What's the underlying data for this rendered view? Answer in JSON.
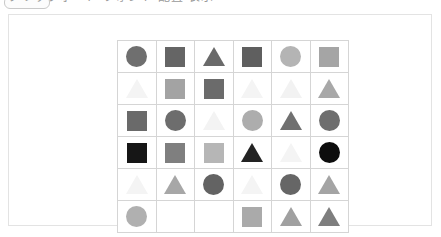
{
  "header": {
    "text": "クリップボード  フォント  配置  表示",
    "pill_label": ""
  },
  "card": {
    "background": "#ffffff",
    "border_color": "#e3e3e3"
  },
  "grid": {
    "rows": 6,
    "cols": 6,
    "line_color": "#d5d5d5",
    "cells": [
      [
        {
          "shape": "circle",
          "color": "#6f6f6f"
        },
        {
          "shape": "square",
          "color": "#656565"
        },
        {
          "shape": "triangle",
          "color": "#6a6a6a"
        },
        {
          "shape": "square",
          "color": "#5f5f5f"
        },
        {
          "shape": "circle",
          "color": "#b4b4b4"
        },
        {
          "shape": "square",
          "color": "#a5a5a5"
        }
      ],
      [
        {
          "shape": "triangle",
          "color": "#f4f4f4"
        },
        {
          "shape": "square",
          "color": "#a3a3a3"
        },
        {
          "shape": "square",
          "color": "#6b6b6b"
        },
        {
          "shape": "triangle",
          "color": "#f4f4f4"
        },
        {
          "shape": "triangle",
          "color": "#f2f2f2"
        },
        {
          "shape": "triangle",
          "color": "#a8a8a8"
        }
      ],
      [
        {
          "shape": "square",
          "color": "#6a6a6a"
        },
        {
          "shape": "circle",
          "color": "#6d6d6d"
        },
        {
          "shape": "triangle",
          "color": "#f3f3f3"
        },
        {
          "shape": "circle",
          "color": "#adadad"
        },
        {
          "shape": "triangle",
          "color": "#707070"
        },
        {
          "shape": "circle",
          "color": "#6e6e6e"
        }
      ],
      [
        {
          "shape": "square",
          "color": "#161616"
        },
        {
          "shape": "square",
          "color": "#7f7f7f"
        },
        {
          "shape": "square",
          "color": "#b6b6b6"
        },
        {
          "shape": "triangle",
          "color": "#232323"
        },
        {
          "shape": "triangle",
          "color": "#f4f4f4"
        },
        {
          "shape": "circle",
          "color": "#0d0d0d"
        }
      ],
      [
        {
          "shape": "triangle",
          "color": "#f4f4f4"
        },
        {
          "shape": "triangle",
          "color": "#a7a7a7"
        },
        {
          "shape": "circle",
          "color": "#636363"
        },
        {
          "shape": "triangle",
          "color": "#f4f4f4"
        },
        {
          "shape": "circle",
          "color": "#666666"
        },
        {
          "shape": "triangle",
          "color": "#a4a4a4"
        }
      ],
      [
        {
          "shape": "circle",
          "color": "#b0b0b0"
        },
        {
          "shape": "empty",
          "color": "#ffffff"
        },
        {
          "shape": "empty",
          "color": "#ffffff"
        },
        {
          "shape": "square",
          "color": "#aaaaaa"
        },
        {
          "shape": "triangle",
          "color": "#a0a0a0"
        },
        {
          "shape": "triangle",
          "color": "#7e7e7e"
        }
      ]
    ]
  }
}
